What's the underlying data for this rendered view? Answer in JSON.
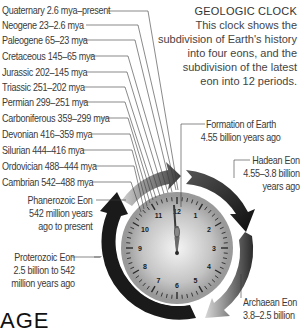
{
  "header": {
    "title": "GEOLOGIC CLOCK",
    "description_lines": [
      "This clock shows the",
      "subdivision of Earth's history",
      "into four eons, and the",
      "subdivision of the latest",
      "eon into 12 periods."
    ]
  },
  "periods": [
    {
      "label": "Quaternary 2.6 mya–present"
    },
    {
      "label": "Neogene 23–2.6 mya"
    },
    {
      "label": "Paleogene 65–23 mya"
    },
    {
      "label": "Cretaceous 145–65 mya"
    },
    {
      "label": "Jurassic 202–145 mya"
    },
    {
      "label": "Triassic 251–202 mya"
    },
    {
      "label": "Permian 299–251 mya"
    },
    {
      "label": "Carboniferous 359–299 mya"
    },
    {
      "label": "Devonian 416–359 mya"
    },
    {
      "label": "Silurian 444–416 mya"
    },
    {
      "label": "Ordovician 488–444 mya"
    },
    {
      "label": "Cambrian 542–488 mya"
    }
  ],
  "eons": {
    "phanerozoic": [
      "Phanerozoic Eon",
      "542 million years",
      "ago to present"
    ],
    "proterozoic": [
      "Proterozoic Eon",
      "2.5 billion to 542",
      "million years ago"
    ],
    "formation": [
      "Formation of Earth",
      "4.55 billion years ago"
    ],
    "hadean": [
      "Hadean Eon",
      "4.55–3.8 billion",
      "years ago"
    ],
    "archaean": [
      "Archaean Eon",
      "3.8–2.5 billion"
    ]
  },
  "clock": {
    "numerals": [
      "12",
      "1",
      "2",
      "3",
      "4",
      "5",
      "6",
      "7",
      "8",
      "9",
      "10",
      "11"
    ],
    "face_color": "#b8b8b8",
    "ring_color": "#1a1a1a"
  },
  "footer": {
    "partial_word": "AGE"
  }
}
